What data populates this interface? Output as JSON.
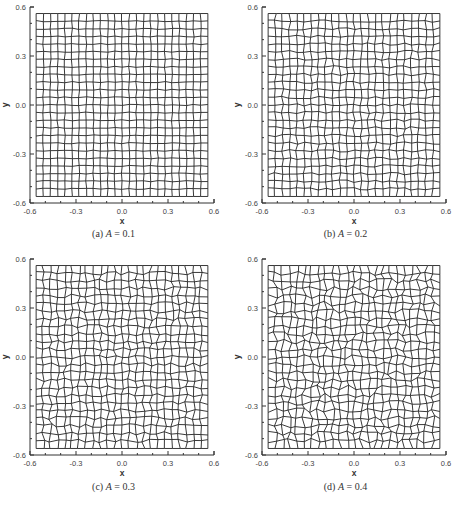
{
  "figure": {
    "panels": [
      {
        "id": "a",
        "caption_prefix": "(a)",
        "caption_var": "A",
        "caption_eq": " = 0.1",
        "amplitude": 0.1
      },
      {
        "id": "b",
        "caption_prefix": "(b)",
        "caption_var": "A",
        "caption_eq": " = 0.2",
        "amplitude": 0.2
      },
      {
        "id": "c",
        "caption_prefix": "(c)",
        "caption_var": "A",
        "caption_eq": " = 0.3",
        "amplitude": 0.3
      },
      {
        "id": "d",
        "caption_prefix": "(d)",
        "caption_var": "A",
        "caption_eq": " = 0.4",
        "amplitude": 0.4
      }
    ],
    "line_color": "#222222",
    "axis_color": "#333333"
  },
  "chart_data": [
    {
      "type": "mesh",
      "title": "(a) A = 0.1",
      "xlabel": "x",
      "ylabel": "y",
      "xlim": [
        -0.6,
        0.6
      ],
      "ylim": [
        -0.6,
        0.6
      ],
      "xticks": [
        "-0.6",
        "-0.3",
        "0.0",
        "0.3",
        "0.6"
      ],
      "yticks": [
        "-0.6",
        "-0.3",
        "0.0",
        "0.3",
        "0.6"
      ],
      "grid_extent": [
        -0.56,
        0.56
      ],
      "grid_cells": 24,
      "perturbation_amplitude": 0.1
    },
    {
      "type": "mesh",
      "title": "(b) A = 0.2",
      "xlabel": "x",
      "ylabel": "y",
      "xlim": [
        -0.6,
        0.6
      ],
      "ylim": [
        -0.6,
        0.6
      ],
      "xticks": [
        "-0.6",
        "-0.3",
        "0.0",
        "0.3",
        "0.6"
      ],
      "yticks": [
        "-0.6",
        "-0.3",
        "0.0",
        "0.3",
        "0.6"
      ],
      "grid_extent": [
        -0.56,
        0.56
      ],
      "grid_cells": 24,
      "perturbation_amplitude": 0.2
    },
    {
      "type": "mesh",
      "title": "(c) A = 0.3",
      "xlabel": "x",
      "ylabel": "y",
      "xlim": [
        -0.6,
        0.6
      ],
      "ylim": [
        -0.6,
        0.6
      ],
      "xticks": [
        "-0.6",
        "-0.3",
        "0.0",
        "0.3",
        "0.6"
      ],
      "yticks": [
        "-0.6",
        "-0.3",
        "0.0",
        "0.3",
        "0.6"
      ],
      "grid_extent": [
        -0.56,
        0.56
      ],
      "grid_cells": 24,
      "perturbation_amplitude": 0.3
    },
    {
      "type": "mesh",
      "title": "(d) A = 0.4",
      "xlabel": "x",
      "ylabel": "y",
      "xlim": [
        -0.6,
        0.6
      ],
      "ylim": [
        -0.6,
        0.6
      ],
      "xticks": [
        "-0.6",
        "-0.3",
        "0.0",
        "0.3",
        "0.6"
      ],
      "yticks": [
        "-0.6",
        "-0.3",
        "0.0",
        "0.3",
        "0.6"
      ],
      "grid_extent": [
        -0.56,
        0.56
      ],
      "grid_cells": 24,
      "perturbation_amplitude": 0.4
    }
  ]
}
